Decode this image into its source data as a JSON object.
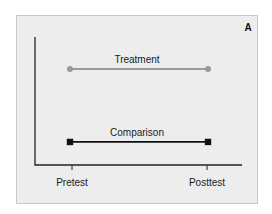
{
  "chart_data": {
    "type": "line",
    "title": "",
    "panel_label": "A",
    "xlabel": "",
    "ylabel": "",
    "categories": [
      "Pretest",
      "Posttest"
    ],
    "ylim": [
      0,
      10
    ],
    "y_units": "arbitrary (no numeric axis shown)",
    "grid": false,
    "legend": "none (series labeled inline above lines)",
    "series": [
      {
        "name": "Treatment",
        "values": [
          7.5,
          7.5
        ],
        "marker": "circle",
        "color": "#9a9a9a"
      },
      {
        "name": "Comparison",
        "values": [
          1.8,
          1.8
        ],
        "marker": "square",
        "color": "#111111"
      }
    ]
  }
}
